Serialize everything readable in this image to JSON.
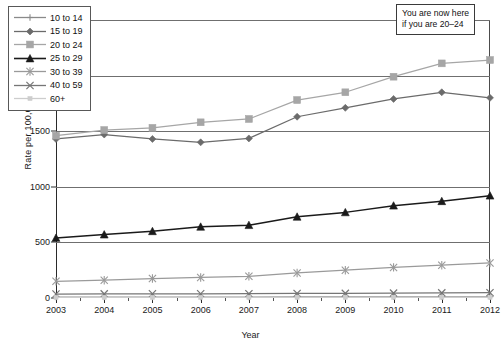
{
  "chart_data": {
    "type": "line",
    "title": "",
    "xlabel": "Year",
    "ylabel": "Rate per 100,000",
    "x": [
      2003,
      2004,
      2005,
      2006,
      2007,
      2008,
      2009,
      2010,
      2011,
      2012
    ],
    "xtick_labels": [
      "2003",
      "2004",
      "2005",
      "2006",
      "2007",
      "2008",
      "2009",
      "2010",
      "2011",
      "2012"
    ],
    "ytick_labels": [
      "0",
      "500",
      "1000",
      "1500",
      "2000",
      "2500"
    ],
    "yticks": [
      0,
      500,
      1000,
      1500,
      2000,
      2500
    ],
    "ylim": [
      0,
      2500
    ],
    "xlim": [
      2003,
      2012
    ],
    "grid": "horizontal",
    "legend_position": "top-left",
    "series": [
      {
        "name": "10 to 14",
        "marker": "plus",
        "color": "#8a8a8a",
        "values": [
          8,
          8,
          8,
          9,
          9,
          10,
          10,
          10,
          11,
          11
        ]
      },
      {
        "name": "15 to 19",
        "marker": "diamond",
        "color": "#6b6b6b",
        "values": [
          1430,
          1470,
          1430,
          1400,
          1435,
          1630,
          1710,
          1790,
          1850,
          1800
        ]
      },
      {
        "name": "20 to 24",
        "marker": "square",
        "color": "#a6a6a6",
        "values": [
          1460,
          1510,
          1530,
          1580,
          1610,
          1780,
          1850,
          1990,
          2110,
          2140
        ]
      },
      {
        "name": "25 to 29",
        "marker": "triangle",
        "color": "#1a1a1a",
        "values": [
          540,
          570,
          600,
          640,
          655,
          730,
          770,
          830,
          870,
          920
        ]
      },
      {
        "name": "30 to 39",
        "marker": "asterisk",
        "color": "#9a9a9a",
        "values": [
          150,
          160,
          175,
          185,
          195,
          225,
          250,
          275,
          295,
          315
        ]
      },
      {
        "name": "40 to 59",
        "marker": "cross",
        "color": "#767676",
        "values": [
          36,
          37,
          38,
          38,
          39,
          41,
          42,
          44,
          46,
          48
        ]
      },
      {
        "name": "60+",
        "marker": "small-square",
        "color": "#cdcdcd",
        "values": [
          5,
          5,
          5,
          5,
          5,
          6,
          6,
          6,
          6,
          6
        ]
      }
    ],
    "annotations": [
      {
        "name": "you-are-now-here-callout",
        "line1": "You are now here",
        "line2": "if you are 20–24"
      }
    ]
  }
}
